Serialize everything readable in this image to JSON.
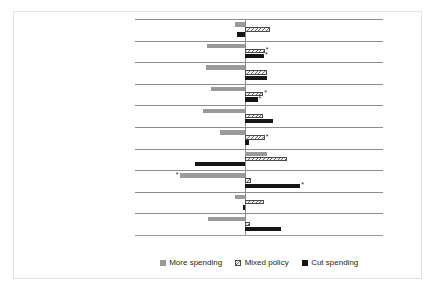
{
  "chart_data": {
    "type": "bar",
    "orientation": "horizontal",
    "title": "",
    "xlabel": "",
    "ylabel": "",
    "xlim": [
      -14.0,
      17.5
    ],
    "grid": false,
    "axis_tick_labels": [
      "-12.0%",
      "-8.0%",
      "-4.0%",
      "0.0%",
      "4.0%",
      "8.0%",
      "12.0%",
      "16.0%"
    ],
    "axis_tick_values": [
      -12.0,
      -8.0,
      -4.0,
      0.0,
      4.0,
      8.0,
      12.0,
      16.0
    ],
    "categories": [
      "Latino",
      "Non-Latino",
      "African American",
      "Non-African American",
      "Foreign relatives",
      "No foreign relatives",
      "Republican",
      "Non-Republican",
      "Min cosmopolitan identity (0)",
      "Max cosmopolitan identity (10)"
    ],
    "legend": {
      "position": "bottom",
      "entries": [
        {
          "label": "More spending",
          "color": "#9a9a9a",
          "key": "more"
        },
        {
          "label": "Mixed policy",
          "color": "#efefef",
          "key": "mixed"
        },
        {
          "label": "Cut spending",
          "color": "#151515",
          "key": "cut"
        }
      ]
    },
    "series": [
      {
        "name": "More spending",
        "key": "more",
        "values": [
          -1.3,
          -4.9,
          -5.0,
          -4.3,
          -5.4,
          -3.2,
          2.8,
          -8.3,
          -1.3,
          -4.7
        ],
        "significant": [
          false,
          false,
          false,
          false,
          false,
          false,
          false,
          true,
          false,
          false
        ]
      },
      {
        "name": "Mixed policy",
        "key": "mixed",
        "values": [
          3.2,
          2.5,
          2.8,
          2.3,
          2.3,
          2.5,
          5.3,
          0.7,
          2.4,
          0.6
        ],
        "significant": [
          false,
          true,
          false,
          true,
          false,
          true,
          false,
          false,
          false,
          false
        ]
      },
      {
        "name": "Cut spending",
        "key": "cut",
        "values": [
          -1.1,
          2.4,
          2.8,
          1.6,
          3.5,
          0.5,
          -6.4,
          7.0,
          -0.3,
          4.6
        ],
        "significant": [
          false,
          true,
          false,
          true,
          false,
          false,
          false,
          true,
          false,
          false
        ]
      }
    ],
    "significance_marker": "*"
  }
}
